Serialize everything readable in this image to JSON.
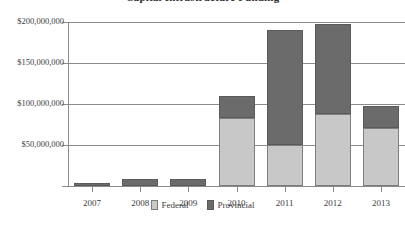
{
  "chart_data": {
    "type": "bar",
    "subtype": "stacked-bar",
    "title": "Capital Infrastructure Funding",
    "xlabel": "",
    "ylabel": "",
    "categories": [
      "2007",
      "2008",
      "2009",
      "2010",
      "2011",
      "2012",
      "2013"
    ],
    "series": [
      {
        "name": "Federal",
        "color": "#c8c8c8",
        "values": [
          0,
          0,
          0,
          83000000,
          50000000,
          88000000,
          71000000
        ]
      },
      {
        "name": "Provincial",
        "color": "#6b6b6b",
        "values": [
          4000000,
          8000000,
          8000000,
          27000000,
          140000000,
          109000000,
          26000000
        ]
      }
    ],
    "totals": [
      4000000,
      8000000,
      8000000,
      110000000,
      190000000,
      197000000,
      97000000
    ],
    "ylim": [
      0,
      200000000
    ],
    "yticks": [
      50000000,
      100000000,
      150000000,
      200000000
    ],
    "ytick_labels": [
      "$50,000,000",
      "$100,000,000",
      "$150,000,000",
      "$200,000,000"
    ],
    "grid": true,
    "legend_position": "bottom"
  },
  "legend": {
    "federal_label": "Federal",
    "provincial_label": "Provincial"
  }
}
